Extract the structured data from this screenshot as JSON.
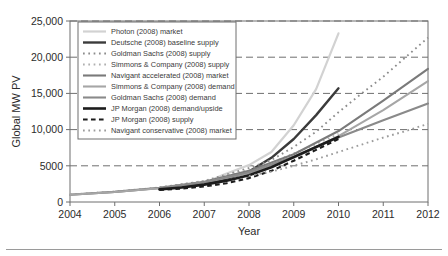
{
  "figure": {
    "background_color": "#ffffff",
    "plot_border_color": "#6f6f6f",
    "gridline_color": "#6f6f6f",
    "footer_rule_color": "#9a9a9a"
  },
  "chart_data": {
    "type": "line",
    "title": "",
    "xlabel": "Year",
    "ylabel": "Global MW PV",
    "xlim": [
      2004,
      2012
    ],
    "ylim": [
      0,
      25000
    ],
    "xticks": [
      2004,
      2005,
      2006,
      2007,
      2008,
      2009,
      2010,
      2011,
      2012
    ],
    "xtick_labels": [
      "2004",
      "2005",
      "2006",
      "2007",
      "2008",
      "2009",
      "2010",
      "2011",
      "2012"
    ],
    "yticks": [
      0,
      5000,
      10000,
      15000,
      20000,
      25000
    ],
    "ytick_labels": [
      "0",
      "5000",
      "10,000",
      "15,000",
      "20,000",
      "25,000"
    ],
    "grid": "horizontal-dashed",
    "legend_position": "upper-left-inside",
    "series": [
      {
        "name": "Photon (2008) market",
        "color": "#d2d2d2",
        "style": "solid",
        "width": 2.2,
        "x": [
          2004,
          2005,
          2006,
          2007,
          2007.4,
          2008,
          2008.5,
          2009,
          2009.5,
          2010
        ],
        "values": [
          1000,
          1400,
          1900,
          2600,
          3700,
          5100,
          6900,
          10600,
          15600,
          23300
        ]
      },
      {
        "name": "Deutsche (2008) baseline supply",
        "color": "#3b3b3b",
        "style": "solid",
        "width": 2.4,
        "x": [
          2006,
          2006.5,
          2007,
          2007.5,
          2008,
          2008.5,
          2009,
          2009.5,
          2010
        ],
        "values": [
          1800,
          2100,
          2600,
          3200,
          4200,
          6100,
          8700,
          12000,
          15700
        ]
      },
      {
        "name": "Goldman Sachs (2008) supply",
        "color": "#8c8c8c",
        "style": "dotted",
        "width": 1.9,
        "x": [
          2006,
          2007,
          2008,
          2008.5,
          2009,
          2009.5,
          2010,
          2010.5,
          2011,
          2011.5,
          2012
        ],
        "values": [
          2000,
          2900,
          4700,
          5800,
          7600,
          9700,
          12400,
          14900,
          17300,
          20000,
          22700
        ]
      },
      {
        "name": "Simmons & Company (2008) supply",
        "color": "#b0b0b0",
        "style": "dotted",
        "width": 1.9,
        "x": [
          2004,
          2005,
          2006,
          2007,
          2008,
          2008.5,
          2009,
          2009.5,
          2010
        ],
        "values": [
          1050,
          1450,
          2000,
          2900,
          4400,
          5400,
          6700,
          8000,
          9400
        ]
      },
      {
        "name": "Navigant accelerated (2008) market",
        "color": "#7a7a7a",
        "style": "solid",
        "width": 2.1,
        "x": [
          2004,
          2005,
          2006,
          2007,
          2008,
          2009,
          2010,
          2011,
          2012
        ],
        "values": [
          1000,
          1400,
          1950,
          2800,
          4300,
          6600,
          9800,
          14000,
          18400
        ]
      },
      {
        "name": "Simmons & Company (2008) demand",
        "color": "#a6a6a6",
        "style": "solid",
        "width": 2.1,
        "x": [
          2004,
          2005,
          2006,
          2007,
          2008,
          2009,
          2010,
          2011,
          2012
        ],
        "values": [
          1000,
          1380,
          1900,
          2700,
          4000,
          6100,
          9100,
          12700,
          16700
        ]
      },
      {
        "name": "Goldman Sachs (2008) demand",
        "color": "#8a8a8a",
        "style": "solid",
        "width": 2.1,
        "x": [
          2006,
          2007,
          2008,
          2009,
          2010,
          2011,
          2012
        ],
        "values": [
          1900,
          2700,
          4100,
          6300,
          8900,
          11300,
          13600
        ]
      },
      {
        "name": "JP Morgan (2008) demand/upside",
        "color": "#1c1c1c",
        "style": "solid",
        "width": 2.6,
        "x": [
          2006,
          2006.5,
          2007,
          2007.5,
          2008,
          2008.5,
          2009,
          2009.5,
          2010
        ],
        "values": [
          1750,
          2000,
          2400,
          2950,
          3700,
          4800,
          6200,
          7600,
          9000
        ]
      },
      {
        "name": "JP Morgan (2008) supply",
        "color": "#1c1c1c",
        "style": "dashed",
        "width": 2.1,
        "x": [
          2006,
          2006.5,
          2007,
          2007.5,
          2008,
          2008.5,
          2009,
          2009.5,
          2010
        ],
        "values": [
          1650,
          1850,
          2150,
          2600,
          3300,
          4300,
          5700,
          7200,
          8700
        ]
      },
      {
        "name": "Navigant conservative (2008) market",
        "color": "#9c9c9c",
        "style": "dotted",
        "width": 1.9,
        "x": [
          2008,
          2008.5,
          2009,
          2009.5,
          2010,
          2010.5,
          2011,
          2011.5,
          2012
        ],
        "values": [
          3600,
          4200,
          5000,
          5900,
          6900,
          7900,
          8900,
          9800,
          10800
        ]
      }
    ]
  }
}
